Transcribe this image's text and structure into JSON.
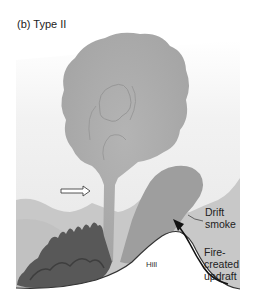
{
  "figure": {
    "title": "(b) Type II",
    "labels": {
      "drift_smoke_line1": "Drift",
      "drift_smoke_line2": "smoke",
      "fire_updraft_line1": "Fire-",
      "fire_updraft_line2": "created",
      "fire_updraft_line3": "updraft",
      "hill": "Hill"
    },
    "colors": {
      "sky": "#ececec",
      "background_mountains": "#c9c9c9",
      "plume": "#a9a9a9",
      "drift_smoke": "#9c9c9c",
      "fire": "#555555",
      "hill": "#ffffff",
      "arrow": "#111111"
    }
  }
}
